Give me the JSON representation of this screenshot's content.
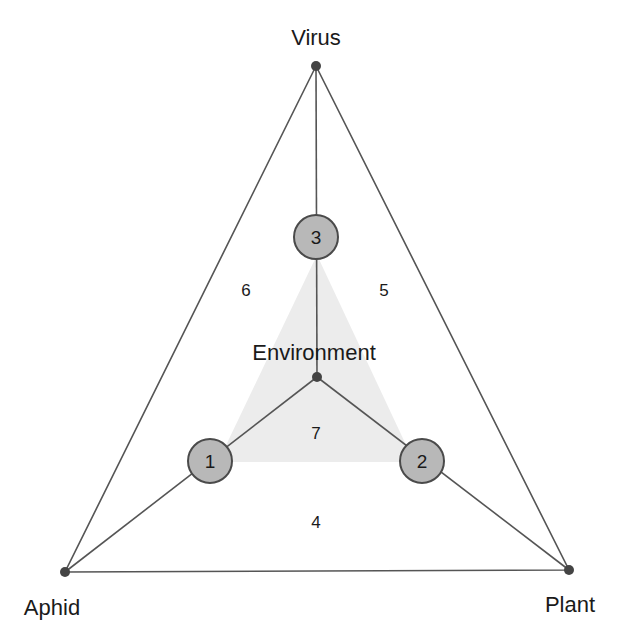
{
  "diagram": {
    "type": "disease-triangle",
    "vertices": {
      "virus": {
        "label": "Virus",
        "x": 316,
        "y": 66
      },
      "aphid": {
        "label": "Aphid",
        "x": 65,
        "y": 572
      },
      "plant": {
        "label": "Plant",
        "x": 569,
        "y": 570
      },
      "environment": {
        "label": "Environment",
        "x": 317,
        "y": 377
      }
    },
    "nodes": [
      {
        "id": "1",
        "label": "1",
        "x": 210,
        "y": 461
      },
      {
        "id": "2",
        "label": "2",
        "x": 422,
        "y": 461
      },
      {
        "id": "3",
        "label": "3",
        "x": 316,
        "y": 237
      }
    ],
    "regions": [
      {
        "id": "4",
        "label": "4",
        "x": 316,
        "y": 521
      },
      {
        "id": "5",
        "label": "5",
        "x": 384,
        "y": 290
      },
      {
        "id": "6",
        "label": "6",
        "x": 246,
        "y": 290
      },
      {
        "id": "7",
        "label": "7",
        "x": 316,
        "y": 432
      }
    ],
    "colors": {
      "line": "#555555",
      "node_fill": "#b8b8b8",
      "node_stroke": "#4a4a4a",
      "shade": "#ececec",
      "dot": "#444444"
    }
  }
}
